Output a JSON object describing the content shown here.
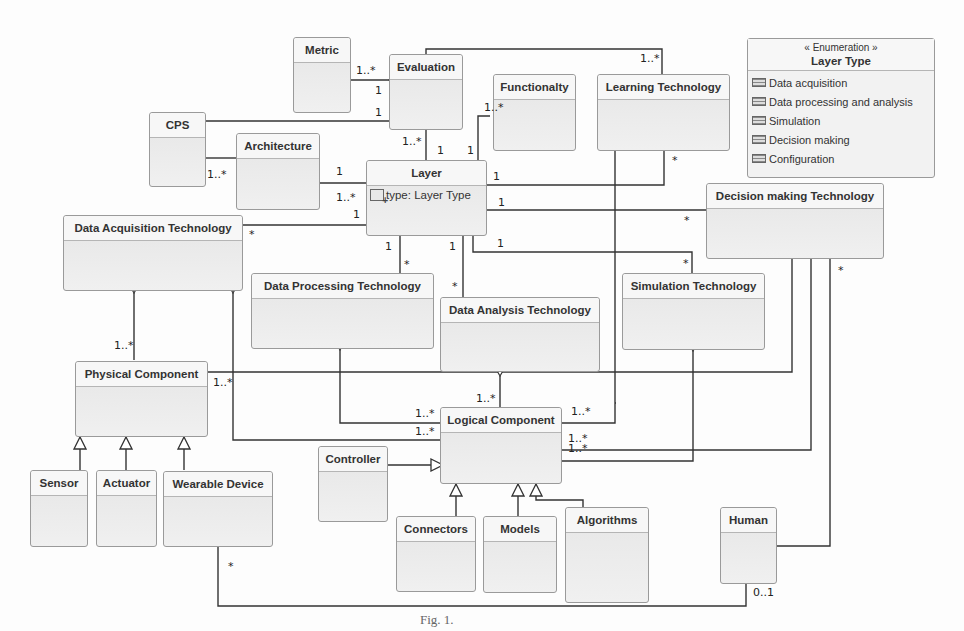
{
  "diagram": {
    "type": "UML class diagram",
    "caption": "Fig. 1.",
    "classes": {
      "metric": {
        "name": "Metric"
      },
      "evaluation": {
        "name": "Evaluation"
      },
      "functionality": {
        "name": "Functionalty"
      },
      "learning_technology": {
        "name": "Learning Technology"
      },
      "cps": {
        "name": "CPS"
      },
      "architecture": {
        "name": "Architecture"
      },
      "layer": {
        "name": "Layer",
        "attribute": "type: Layer Type"
      },
      "data_acquisition_technology": {
        "name": "Data Acquisition Technology"
      },
      "decision_making_technology": {
        "name": "Decision making Technology"
      },
      "data_processing_technology": {
        "name": "Data Processing Technology"
      },
      "data_analysis_technology": {
        "name": "Data Analysis Technology"
      },
      "simulation_technology": {
        "name": "Simulation Technology"
      },
      "physical_component": {
        "name": "Physical Component"
      },
      "logical_component": {
        "name": "Logical Component"
      },
      "controller": {
        "name": "Controller"
      },
      "sensor": {
        "name": "Sensor"
      },
      "actuator": {
        "name": "Actuator"
      },
      "wearable_device": {
        "name": "Wearable Device"
      },
      "connectors": {
        "name": "Connectors"
      },
      "models": {
        "name": "Models"
      },
      "algorithms": {
        "name": "Algorithms"
      },
      "human": {
        "name": "Human"
      }
    },
    "enumeration": {
      "stereotype": "« Enumeration »",
      "name": "Layer Type",
      "literals": [
        "Data acquisition",
        "Data processing and analysis",
        "Simulation",
        "Decision making",
        "Configuration"
      ]
    },
    "multiplicities": {
      "metric_eval_metric": "1..*",
      "metric_eval_eval": "1",
      "cps_eval": "1",
      "eval_layer_top": "1..*",
      "eval_layer_bottom": "1",
      "layer_func": "1",
      "func_layer": "1..*",
      "func_top": "1..*",
      "learn_top": "1..*",
      "learn_layer": "*",
      "layer_learn": "1",
      "cps_arch": "1..*",
      "arch_layer_arch": "1",
      "arch_layer_layer": "1..*",
      "layer_daq_layer": "1",
      "layer_daq_daq": "*",
      "layer_dmt_layer": "1",
      "layer_dmt_dmt": "*",
      "layer_dpt_layer": "1",
      "layer_dpt_dpt": "*",
      "layer_dat_layer": "1",
      "layer_dat_dat": "*",
      "layer_sim_layer": "1",
      "layer_sim_sim": "*",
      "daq_phys": "1..*",
      "phys_right": "1..*",
      "dat_logical": "1..*",
      "dpt_logical": "1..*",
      "daq_logical": "1..*",
      "learn_logical": "1..*",
      "dmt_logical_1": "1..*",
      "sim_logical": "1..*",
      "dmt_human": "*",
      "wearable_human": "*",
      "human_wearable": "0..1"
    }
  }
}
